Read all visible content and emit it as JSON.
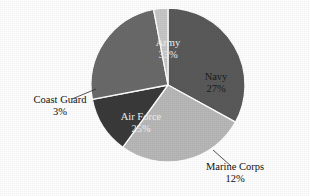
{
  "chart_data": {
    "type": "pie",
    "title": "",
    "subtitle": "",
    "xlabel": "",
    "ylabel": "",
    "grid": false,
    "legend_position": "none",
    "label_format": "name + percent",
    "total_percent": 100,
    "start_angle_deg": 0,
    "direction": "clockwise",
    "categories": [
      "Army",
      "Navy",
      "Marine Corps",
      "Air Force",
      "Coast Guard"
    ],
    "values": [
      33,
      27,
      12,
      25,
      3
    ],
    "slices": [
      {
        "name": "Army",
        "label": "Army",
        "percent_text": "33%",
        "value": 33,
        "color": "#5a5a5a",
        "label_placement": "inside",
        "label_x": 168,
        "label_y": 44,
        "text_tone": "dark-bg"
      },
      {
        "name": "Navy",
        "label": "Navy",
        "percent_text": "27%",
        "value": 27,
        "color": "#b8b8b8",
        "label_placement": "inside",
        "label_x": 216,
        "label_y": 78,
        "text_tone": "light-bg"
      },
      {
        "name": "Marine Corps",
        "label": "Marine Corps",
        "percent_text": "12%",
        "value": 12,
        "color": "#3a3a3a",
        "label_placement": "outside",
        "label_x": 235,
        "label_y": 168,
        "text_tone": "light-bg",
        "leader": "M 213 150 L 231 166"
      },
      {
        "name": "Air Force",
        "label": "Air Force",
        "percent_text": "25%",
        "value": 25,
        "color": "#6a6a6a",
        "label_placement": "inside",
        "label_x": 141,
        "label_y": 118,
        "text_tone": "dark-bg"
      },
      {
        "name": "Coast Guard",
        "label": "Coast Guard",
        "percent_text": "3%",
        "value": 3,
        "color": "#c8c8c8",
        "label_placement": "outside",
        "label_x": 60,
        "label_y": 101,
        "text_tone": "light-bg",
        "leader": "M 96 89 L 72 99"
      }
    ],
    "geometry": {
      "center_x": 168,
      "center_y": 85,
      "radius": 77
    },
    "background_color": "#ffffff"
  }
}
